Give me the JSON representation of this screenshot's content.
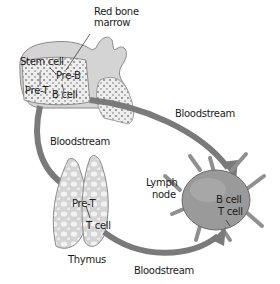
{
  "diagram": {
    "type": "lymphocyte-maturation-pathway",
    "colors": {
      "bloodstream_arrow": "#7a7a7a",
      "bone": "#d2d2d2",
      "thymus": "#dcdcdc",
      "lymph_node": "#8f8f8f",
      "text": "#1a1a1a"
    },
    "labels": {
      "red_bone_marrow_line1": "Red bone",
      "red_bone_marrow_line2": "marrow",
      "stem_cell": "Stem cell",
      "pre_b": "Pre-B",
      "pre_t_marrow": "Pre-T",
      "b_cell_marrow": "B cell",
      "bloodstream_left": "Bloodstream",
      "bloodstream_right": "Bloodstream",
      "bloodstream_bottom": "Bloodstream",
      "thymus_pre_t": "Pre-T",
      "thymus_t_cell": "T cell",
      "thymus": "Thymus",
      "lymph_node_line1": "Lymph",
      "lymph_node_line2": "node",
      "lymph_b_cell": "B cell",
      "lymph_t_cell": "T cell"
    },
    "nodes": [
      {
        "id": "bone-marrow",
        "label": "Red bone marrow"
      },
      {
        "id": "thymus",
        "label": "Thymus"
      },
      {
        "id": "lymph-node",
        "label": "Lymph node"
      }
    ],
    "edges": [
      {
        "from": "bone-marrow",
        "to": "thymus",
        "label": "Bloodstream",
        "carries": "Pre-T"
      },
      {
        "from": "bone-marrow",
        "to": "lymph-node",
        "label": "Bloodstream",
        "carries": "B cell"
      },
      {
        "from": "thymus",
        "to": "lymph-node",
        "label": "Bloodstream",
        "carries": "T cell"
      }
    ]
  }
}
